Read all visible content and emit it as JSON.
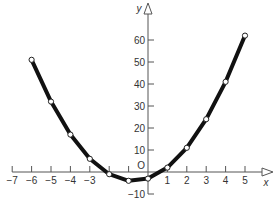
{
  "chart_data": {
    "type": "line",
    "title": "",
    "xlabel": "x",
    "ylabel": "y",
    "origin_label": "O",
    "xlim": [
      -7,
      5.5
    ],
    "ylim": [
      -10,
      70
    ],
    "grid": false,
    "legend": null,
    "x_ticks": [
      -7,
      -6,
      -5,
      -4,
      -3,
      -2,
      -1,
      0,
      1,
      2,
      3,
      4,
      5
    ],
    "x_tick_labels": [
      "−7",
      "−6",
      "−5",
      "−4",
      "−3",
      "1",
      "2",
      "3",
      "4",
      "5"
    ],
    "y_ticks": [
      -10,
      0,
      10,
      20,
      30,
      40,
      50,
      60
    ],
    "y_tick_labels": [
      "−10",
      "10",
      "20",
      "30",
      "40",
      "50",
      "60"
    ],
    "series": [
      {
        "name": "y = 2x² + 3x − 3",
        "x": [
          -6,
          -5,
          -4,
          -3,
          -2,
          -1,
          0,
          1,
          2,
          3,
          4,
          5
        ],
        "values": [
          51,
          32,
          17,
          6,
          -1,
          -4,
          -3,
          2,
          11,
          24,
          41,
          62
        ],
        "line_color": "#111111",
        "marker": "open-circle"
      }
    ]
  }
}
